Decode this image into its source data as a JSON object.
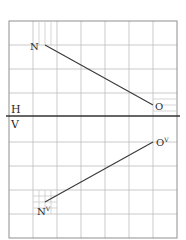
{
  "diagram": {
    "type": "orthographic-projection-grid",
    "grid": {
      "left": 9,
      "top": 21,
      "cell": 24,
      "cols": 7,
      "rows": 9,
      "color": "#b8b8b8",
      "border_color": "#8a8a8a"
    },
    "reference_line": {
      "y": 116,
      "upper_label": "H",
      "lower_label": "V",
      "color": "#333333"
    },
    "top_view": {
      "line": {
        "from": "N",
        "to": "O"
      },
      "points": [
        {
          "id": "N",
          "label": "N",
          "x": 45,
          "y": 45
        },
        {
          "id": "O",
          "label": "O",
          "x": 153,
          "y": 105
        }
      ]
    },
    "front_view": {
      "line": {
        "from": "Nv",
        "to": "Ov"
      },
      "points": [
        {
          "id": "Nv",
          "label": "N",
          "sup": "V",
          "x": 45,
          "y": 202
        },
        {
          "id": "Ov",
          "label": "O",
          "sup": "V",
          "x": 153,
          "y": 142
        }
      ]
    },
    "line_color": "#3a3a3a"
  }
}
